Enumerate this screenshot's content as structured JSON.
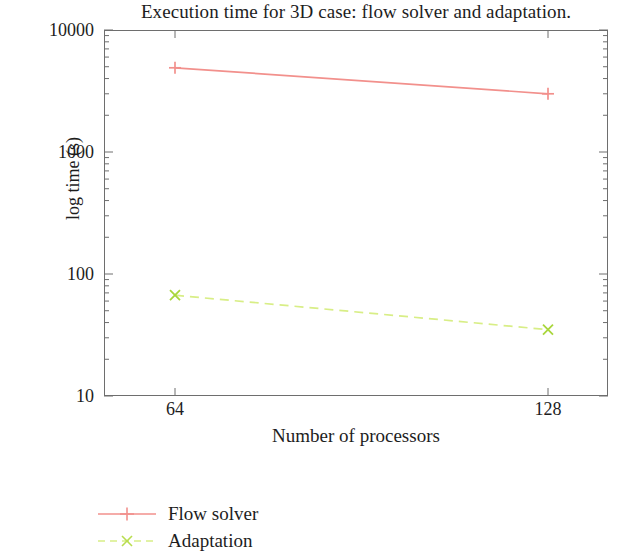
{
  "chart_data": {
    "type": "line",
    "title": "Execution time for 3D case: flow solver and adaptation.",
    "xlabel": "Number of processors",
    "ylabel": "log time (s)",
    "x": [
      64,
      128
    ],
    "xtick_labels": [
      "64",
      "128"
    ],
    "ytick_labels": [
      "10",
      "100",
      "1000",
      "10000"
    ],
    "ylim": [
      10,
      10000
    ],
    "yscale": "log",
    "xscale": "linear",
    "grid": false,
    "legend_position": "below-left",
    "series": [
      {
        "name": "Flow solver",
        "values": [
          4900,
          3000
        ],
        "color": "#f2908c",
        "marker": "plus",
        "linestyle": "solid"
      },
      {
        "name": "Adaptation",
        "values": [
          67,
          35
        ],
        "color": "#d8ee86",
        "marker": "cross",
        "linestyle": "dashed"
      }
    ]
  },
  "axes": {
    "y_ticks": [
      {
        "label": "10000",
        "value": 10000
      },
      {
        "label": "1000",
        "value": 1000
      },
      {
        "label": "100",
        "value": 100
      },
      {
        "label": "10",
        "value": 10
      }
    ],
    "x_ticks": [
      {
        "label": "64",
        "value": 64
      },
      {
        "label": "128",
        "value": 128
      }
    ]
  },
  "legend": {
    "entries": [
      {
        "label": "Flow solver"
      },
      {
        "label": "Adaptation"
      }
    ]
  },
  "colors": {
    "flow_solver": "#f2908c",
    "adaptation": "#d8ee86",
    "axis": "#6e6e6e",
    "text": "#1d1d1d"
  }
}
